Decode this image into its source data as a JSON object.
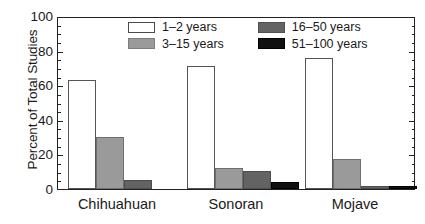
{
  "chart_data": {
    "type": "bar",
    "title": "",
    "xlabel": "",
    "ylabel": "Percent of Total Studies",
    "categories": [
      "Chihuahuan",
      "Sonoran",
      "Mojave"
    ],
    "series": [
      {
        "name": "1–2 years",
        "values": [
          63.5,
          72,
          76.5
        ],
        "color": "#ffffff"
      },
      {
        "name": "3–15 years",
        "values": [
          30.5,
          12.5,
          17.5
        ],
        "color": "#9a9a9a"
      },
      {
        "name": "16–50 years",
        "values": [
          5.5,
          10.5,
          1.5
        ],
        "color": "#636363"
      },
      {
        "name": "51–100 years",
        "values": [
          0,
          4,
          1.5
        ],
        "color": "#101010"
      }
    ],
    "ylim": [
      0,
      100
    ],
    "y_ticks": [
      0,
      20,
      40,
      60,
      80,
      100
    ],
    "y_tick_labels": [
      "0",
      "20",
      "40",
      "60",
      "80",
      "100"
    ],
    "y_minor_tick_step": 5,
    "grid": false,
    "legend_position": "upper-center",
    "background_color": "#ffffff",
    "axis_color": "#222222"
  },
  "axis": {
    "y_title": "Percent of Total Studies",
    "y_labels": [
      "100",
      "80",
      "60",
      "40",
      "20",
      "0"
    ],
    "x_labels": [
      "Chihuahuan",
      "Sonoran",
      "Mojave"
    ]
  },
  "legend": {
    "items": [
      {
        "label": "1–2 years"
      },
      {
        "label": "3–15 years"
      },
      {
        "label": "16–50 years"
      },
      {
        "label": "51–100 years"
      }
    ]
  }
}
